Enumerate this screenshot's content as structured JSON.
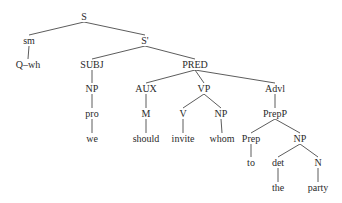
{
  "diagram": {
    "type": "syntax-tree",
    "nodes": [
      {
        "id": "S",
        "label": "S",
        "x": 84,
        "y": 17
      },
      {
        "id": "sm",
        "label": "sm",
        "x": 29,
        "y": 41
      },
      {
        "id": "Sp",
        "label": "S'",
        "x": 145,
        "y": 41
      },
      {
        "id": "Qwh",
        "label": "Q–wh",
        "x": 28,
        "y": 65
      },
      {
        "id": "SUBJ",
        "label": "SUBJ",
        "x": 92,
        "y": 65
      },
      {
        "id": "PRED",
        "label": "PRED",
        "x": 195,
        "y": 65
      },
      {
        "id": "NP1",
        "label": "NP",
        "x": 92,
        "y": 89
      },
      {
        "id": "AUX",
        "label": "AUX",
        "x": 146,
        "y": 89
      },
      {
        "id": "VP",
        "label": "VP",
        "x": 204,
        "y": 89
      },
      {
        "id": "Advl",
        "label": "Advl",
        "x": 275,
        "y": 89
      },
      {
        "id": "pro",
        "label": "pro",
        "x": 92,
        "y": 114
      },
      {
        "id": "M",
        "label": "M",
        "x": 146,
        "y": 114
      },
      {
        "id": "V",
        "label": "V",
        "x": 183,
        "y": 114
      },
      {
        "id": "NP2",
        "label": "NP",
        "x": 221,
        "y": 114
      },
      {
        "id": "PrepP",
        "label": "PrepP",
        "x": 275,
        "y": 114
      },
      {
        "id": "we",
        "label": "we",
        "x": 92,
        "y": 139
      },
      {
        "id": "should",
        "label": "should",
        "x": 146,
        "y": 139
      },
      {
        "id": "invite",
        "label": "invite",
        "x": 183,
        "y": 139
      },
      {
        "id": "whom",
        "label": "whom",
        "x": 222,
        "y": 139
      },
      {
        "id": "Prep",
        "label": "Prep",
        "x": 251,
        "y": 139
      },
      {
        "id": "NP3",
        "label": "NP",
        "x": 300,
        "y": 139
      },
      {
        "id": "to",
        "label": "to",
        "x": 251,
        "y": 163
      },
      {
        "id": "det",
        "label": "det",
        "x": 278,
        "y": 163
      },
      {
        "id": "N",
        "label": "N",
        "x": 318,
        "y": 163
      },
      {
        "id": "the",
        "label": "the",
        "x": 278,
        "y": 188
      },
      {
        "id": "party",
        "label": "party",
        "x": 318,
        "y": 188
      }
    ],
    "edges": [
      [
        "S",
        "sm"
      ],
      [
        "S",
        "Sp"
      ],
      [
        "sm",
        "Qwh"
      ],
      [
        "Sp",
        "SUBJ"
      ],
      [
        "Sp",
        "PRED"
      ],
      [
        "SUBJ",
        "NP1"
      ],
      [
        "NP1",
        "pro"
      ],
      [
        "pro",
        "we"
      ],
      [
        "PRED",
        "AUX"
      ],
      [
        "PRED",
        "VP"
      ],
      [
        "PRED",
        "Advl"
      ],
      [
        "AUX",
        "M"
      ],
      [
        "M",
        "should"
      ],
      [
        "VP",
        "V"
      ],
      [
        "VP",
        "NP2"
      ],
      [
        "V",
        "invite"
      ],
      [
        "NP2",
        "whom"
      ],
      [
        "Advl",
        "PrepP"
      ],
      [
        "PrepP",
        "Prep"
      ],
      [
        "PrepP",
        "NP3"
      ],
      [
        "Prep",
        "to"
      ],
      [
        "NP3",
        "det"
      ],
      [
        "NP3",
        "N"
      ],
      [
        "det",
        "the"
      ],
      [
        "N",
        "party"
      ]
    ]
  }
}
